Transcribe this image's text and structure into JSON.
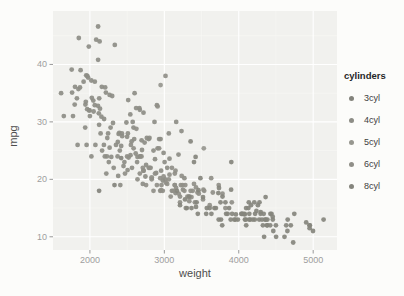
{
  "figure": {
    "width": 404,
    "height": 296,
    "background": "#fcfcfa",
    "panel_background": "#f1f1ee",
    "grid_major_color": "#ffffff",
    "grid_minor_color": "#f8f8f4",
    "tick_mark_color": "#999999",
    "tick_label_color": "#9e9e9e",
    "axis_title_color": "#4d4d4d"
  },
  "chart_data": {
    "type": "scatter",
    "title": "",
    "xlabel": "weight",
    "ylabel": "mpg",
    "xlim": [
      1504,
      5320
    ],
    "ylim": [
      7.7,
      49.3
    ],
    "x_ticks": [
      2000,
      3000,
      4000,
      5000
    ],
    "y_ticks": [
      10,
      20,
      30,
      40
    ],
    "x_minor_ticks": [
      2500,
      3500,
      4500
    ],
    "y_minor_ticks": [
      15,
      25,
      35,
      45
    ],
    "grid": true,
    "point_radius": 2.4,
    "legend": {
      "title": "cylinders",
      "position": "right",
      "items": [
        "3cyl",
        "4cyl",
        "5cyl",
        "6cyl",
        "8cyl"
      ]
    },
    "series": [
      {
        "name": "3cyl",
        "color": "#83837c",
        "points": [
          [
            2124,
            18
          ],
          [
            2330,
            19
          ],
          [
            2420,
            23.7
          ],
          [
            2720,
            21.5
          ]
        ]
      },
      {
        "name": "4cyl",
        "color": "#8d8d86",
        "points": [
          [
            1613,
            35
          ],
          [
            1649,
            31
          ],
          [
            1755,
            39.1
          ],
          [
            1760,
            35.1
          ],
          [
            1773,
            31
          ],
          [
            1795,
            33
          ],
          [
            1800,
            36.1
          ],
          [
            1825,
            34.1
          ],
          [
            1835,
            26
          ],
          [
            1845,
            35.7
          ],
          [
            1850,
            44.6
          ],
          [
            1867,
            36
          ],
          [
            1875,
            39
          ],
          [
            1915,
            37
          ],
          [
            1937,
            29
          ],
          [
            1940,
            33
          ],
          [
            1945,
            33.5
          ],
          [
            1950,
            38.1
          ],
          [
            1955,
            26
          ],
          [
            1963,
            32.2
          ],
          [
            1965,
            38
          ],
          [
            1975,
            37.7
          ],
          [
            1985,
            43.1
          ],
          [
            1990,
            32
          ],
          [
            1995,
            32
          ],
          [
            2000,
            31
          ],
          [
            2019,
            37.2
          ],
          [
            2020,
            24
          ],
          [
            2025,
            34.2
          ],
          [
            2045,
            33.7
          ],
          [
            2050,
            31.8
          ],
          [
            2065,
            37
          ],
          [
            2065,
            32.9
          ],
          [
            2074,
            26
          ],
          [
            2085,
            44.3
          ],
          [
            2108,
            32.8
          ],
          [
            2110,
            46.6
          ],
          [
            2110,
            40.8
          ],
          [
            2120,
            31.5
          ],
          [
            2123,
            29.5
          ],
          [
            2125,
            34.1
          ],
          [
            2130,
            44
          ],
          [
            2135,
            32.3
          ],
          [
            2144,
            28
          ],
          [
            2155,
            30.9
          ],
          [
            2160,
            36.1
          ],
          [
            2164,
            25
          ],
          [
            2188,
            26
          ],
          [
            2190,
            30.5
          ],
          [
            2200,
            24
          ],
          [
            2205,
            36
          ],
          [
            2215,
            35.1
          ],
          [
            2220,
            21
          ],
          [
            2228,
            24
          ],
          [
            2234,
            27.2
          ],
          [
            2245,
            28
          ],
          [
            2254,
            23
          ],
          [
            2264,
            25.5
          ],
          [
            2265,
            34.7
          ],
          [
            2278,
            29
          ],
          [
            2288,
            23.9
          ],
          [
            2300,
            34.5
          ],
          [
            2310,
            29.8
          ],
          [
            2320,
            22
          ],
          [
            2335,
            43.4
          ],
          [
            2350,
            26
          ],
          [
            2372,
            24
          ],
          [
            2375,
            26.5
          ],
          [
            2380,
            20.6
          ],
          [
            2385,
            27.9
          ],
          [
            2395,
            28.1
          ],
          [
            2401,
            25
          ],
          [
            2408,
            19
          ],
          [
            2420,
            25.8
          ],
          [
            2430,
            28
          ],
          [
            2434,
            27.5
          ],
          [
            2451,
            22.3
          ],
          [
            2464,
            23
          ],
          [
            2490,
            29.9
          ],
          [
            2500,
            27.4
          ],
          [
            2506,
            21.6
          ],
          [
            2511,
            28
          ],
          [
            2515,
            33.8
          ],
          [
            2520,
            23.8
          ],
          [
            2542,
            31.3
          ],
          [
            2545,
            24.2
          ],
          [
            2560,
            26.6
          ],
          [
            2565,
            22
          ],
          [
            2575,
            30
          ],
          [
            2585,
            29
          ],
          [
            2595,
            27
          ],
          [
            2600,
            35
          ],
          [
            2615,
            24.5
          ],
          [
            2620,
            32.4
          ],
          [
            2634,
            23
          ],
          [
            2640,
            23.9
          ],
          [
            2665,
            32.4
          ],
          [
            2670,
            32.1
          ],
          [
            2671,
            24
          ],
          [
            2678,
            24
          ],
          [
            2694,
            26.8
          ],
          [
            2700,
            25.1
          ],
          [
            2711,
            19.2
          ],
          [
            2720,
            31.6
          ],
          [
            2735,
            26.4
          ],
          [
            2745,
            20.5
          ],
          [
            2755,
            22.5
          ],
          [
            2765,
            27.2
          ],
          [
            2790,
            27
          ],
          [
            2800,
            27.2
          ],
          [
            2815,
            22
          ],
          [
            2830,
            20.3
          ],
          [
            2855,
            25
          ],
          [
            2868,
            30
          ],
          [
            2875,
            23.5
          ],
          [
            2890,
            21.1
          ],
          [
            2900,
            32.9
          ],
          [
            2910,
            25.4
          ],
          [
            2930,
            27
          ],
          [
            2945,
            18
          ],
          [
            2950,
            27
          ],
          [
            2957,
            21.5
          ],
          [
            2979,
            19.8
          ],
          [
            2990,
            24.6
          ],
          [
            3003,
            23
          ],
          [
            3012,
            20
          ],
          [
            3039,
            22
          ],
          [
            3060,
            28
          ],
          [
            3070,
            23.6
          ],
          [
            3102,
            18
          ],
          [
            3140,
            19
          ],
          [
            3150,
            17.6
          ],
          [
            3160,
            30
          ],
          [
            3190,
            24.3
          ],
          [
            3210,
            17
          ],
          [
            3230,
            28.4
          ],
          [
            3250,
            18.2
          ],
          [
            3270,
            20.2
          ]
        ]
      },
      {
        "name": "5cyl",
        "color": "#97978f",
        "points": [
          [
            2830,
            20.3
          ],
          [
            2950,
            36.4
          ],
          [
            3530,
            25.4
          ]
        ]
      },
      {
        "name": "6cyl",
        "color": "#908f88",
        "points": [
          [
            2472,
            21
          ],
          [
            2500,
            24
          ],
          [
            2551,
            26
          ],
          [
            2587,
            25.4
          ],
          [
            2625,
            28.8
          ],
          [
            2640,
            20
          ],
          [
            2670,
            21
          ],
          [
            2693,
            24
          ],
          [
            2711,
            22
          ],
          [
            2720,
            21.5
          ],
          [
            2755,
            19
          ],
          [
            2790,
            22
          ],
          [
            2800,
            22
          ],
          [
            2830,
            20
          ],
          [
            2855,
            18
          ],
          [
            2875,
            21
          ],
          [
            2900,
            19
          ],
          [
            2910,
            32.7
          ],
          [
            2930,
            25.4
          ],
          [
            2945,
            20.2
          ],
          [
            2957,
            18.1
          ],
          [
            2962,
            19
          ],
          [
            2979,
            18
          ],
          [
            2990,
            20.5
          ],
          [
            3015,
            38
          ],
          [
            3021,
            19.4
          ],
          [
            3039,
            19.2
          ],
          [
            3060,
            20
          ],
          [
            3070,
            20.8
          ],
          [
            3085,
            17
          ],
          [
            3102,
            22
          ],
          [
            3121,
            18
          ],
          [
            3139,
            19
          ],
          [
            3140,
            21
          ],
          [
            3150,
            21.5
          ],
          [
            3158,
            18.5
          ],
          [
            3193,
            17.5
          ],
          [
            3211,
            16
          ],
          [
            3221,
            19
          ],
          [
            3233,
            20.6
          ],
          [
            3245,
            19
          ],
          [
            3270,
            18
          ],
          [
            3282,
            19
          ],
          [
            3288,
            15
          ],
          [
            3310,
            17
          ],
          [
            3329,
            17
          ],
          [
            3336,
            16.2
          ],
          [
            3353,
            18
          ],
          [
            3365,
            16.9
          ],
          [
            3381,
            18
          ],
          [
            3399,
            19.2
          ],
          [
            3410,
            16
          ],
          [
            3425,
            18.6
          ],
          [
            3445,
            17.7
          ],
          [
            3465,
            17.5
          ],
          [
            3520,
            16.5
          ],
          [
            3525,
            18.2
          ],
          [
            3535,
            18
          ],
          [
            3609,
            15.5
          ],
          [
            3630,
            20.2
          ],
          [
            3651,
            17.7
          ],
          [
            3730,
            19
          ],
          [
            3781,
            17.5
          ],
          [
            3820,
            15
          ],
          [
            3907,
            16
          ]
        ]
      },
      {
        "name": "8cyl",
        "color": "#85857d",
        "points": [
          [
            3169,
            18
          ],
          [
            3211,
            15.5
          ],
          [
            3278,
            16.5
          ],
          [
            3302,
            15
          ],
          [
            3336,
            17
          ],
          [
            3353,
            26.6
          ],
          [
            3365,
            15
          ],
          [
            3399,
            23
          ],
          [
            3420,
            23.9
          ],
          [
            3425,
            15.2
          ],
          [
            3433,
            16
          ],
          [
            3449,
            14
          ],
          [
            3459,
            18.1
          ],
          [
            3485,
            20.2
          ],
          [
            3520,
            16.9
          ],
          [
            3563,
            14
          ],
          [
            3570,
            15
          ],
          [
            3609,
            15
          ],
          [
            3632,
            14
          ],
          [
            3672,
            15
          ],
          [
            3693,
            15
          ],
          [
            3725,
            17.6
          ],
          [
            3730,
            13
          ],
          [
            3735,
            18.5
          ],
          [
            3755,
            16
          ],
          [
            3761,
            13
          ],
          [
            3777,
            12
          ],
          [
            3781,
            17
          ],
          [
            3821,
            16
          ],
          [
            3830,
            14
          ],
          [
            3850,
            14
          ],
          [
            3870,
            15
          ],
          [
            3892,
            13
          ],
          [
            3897,
            18.2
          ],
          [
            3900,
            23
          ],
          [
            3910,
            14
          ],
          [
            3940,
            13
          ],
          [
            3955,
            13
          ],
          [
            3962,
            13.9
          ],
          [
            3988,
            13
          ],
          [
            4034,
            14
          ],
          [
            4042,
            14
          ],
          [
            4054,
            14
          ],
          [
            4077,
            14
          ],
          [
            4080,
            13.9
          ],
          [
            4082,
            13
          ],
          [
            4096,
            13
          ],
          [
            4098,
            15
          ],
          [
            4100,
            12
          ],
          [
            4129,
            15
          ],
          [
            4135,
            16
          ],
          [
            4140,
            13
          ],
          [
            4141,
            14
          ],
          [
            4154,
            13
          ],
          [
            4165,
            15.5
          ],
          [
            4190,
            13
          ],
          [
            4209,
            16
          ],
          [
            4215,
            13
          ],
          [
            4220,
            14
          ],
          [
            4237,
            14.5
          ],
          [
            4257,
            15.5
          ],
          [
            4274,
            13
          ],
          [
            4278,
            16
          ],
          [
            4294,
            14
          ],
          [
            4295,
            14.3
          ],
          [
            4312,
            13
          ],
          [
            4325,
            12
          ],
          [
            4335,
            14
          ],
          [
            4341,
            10
          ],
          [
            4354,
            13
          ],
          [
            4360,
            16.9
          ],
          [
            4363,
            13
          ],
          [
            4380,
            12
          ],
          [
            4382,
            12
          ],
          [
            4385,
            13
          ],
          [
            4422,
            12
          ],
          [
            4425,
            14
          ],
          [
            4440,
            14
          ],
          [
            4456,
            13.5
          ],
          [
            4457,
            13
          ],
          [
            4464,
            11
          ],
          [
            4499,
            12
          ],
          [
            4502,
            10
          ],
          [
            4615,
            10
          ],
          [
            4638,
            12
          ],
          [
            4654,
            11
          ],
          [
            4657,
            13
          ],
          [
            4699,
            12
          ],
          [
            4732,
            9
          ],
          [
            4746,
            14
          ],
          [
            4906,
            12.5
          ],
          [
            4951,
            12
          ],
          [
            4952,
            11.5
          ],
          [
            4955,
            12
          ],
          [
            4997,
            11
          ],
          [
            5140,
            13
          ]
        ]
      }
    ]
  }
}
